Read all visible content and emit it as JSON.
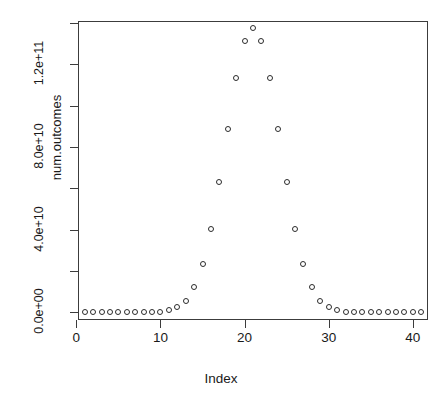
{
  "chart_data": {
    "type": "scatter",
    "title": "",
    "xlabel": "Index",
    "ylabel": "num.outcomes",
    "xlim": [
      0.2,
      41.8
    ],
    "ylim": [
      -3800000000,
      141000000000
    ],
    "grid": false,
    "legend": null,
    "point_symbol": "open-circle",
    "point_color": "#2b2b2b",
    "x": [
      1,
      2,
      3,
      4,
      5,
      6,
      7,
      8,
      9,
      10,
      11,
      12,
      13,
      14,
      15,
      16,
      17,
      18,
      19,
      20,
      21,
      22,
      23,
      24,
      25,
      26,
      27,
      28,
      29,
      30,
      31,
      32,
      33,
      34,
      35,
      36,
      37,
      38,
      39,
      40,
      41
    ],
    "y": [
      1,
      40,
      780,
      9880,
      91390,
      658008,
      3838380,
      18643560,
      76904685,
      273438880,
      847660528,
      2311801440,
      5586853480,
      12033222880,
      23206929840,
      40225345056,
      62852101650,
      88732378800,
      113380261800,
      131282408400,
      137846528820,
      131282408400,
      113380261800,
      88732378800,
      62852101650,
      40225345056,
      23206929840,
      12033222880,
      5586853480,
      2311801440,
      847660528,
      273438880,
      76904685,
      18643560,
      3838380,
      658008,
      91390,
      9880,
      780,
      40,
      1
    ],
    "x_ticks": [
      0,
      10,
      20,
      30,
      40
    ],
    "x_tick_labels": [
      "0",
      "10",
      "20",
      "30",
      "40"
    ],
    "y_ticks": [
      0,
      20000000000,
      40000000000,
      60000000000,
      80000000000,
      100000000000,
      120000000000,
      140000000000
    ],
    "y_major_ticks": [
      0,
      40000000000,
      80000000000,
      120000000000
    ],
    "y_major_tick_labels": [
      "0.0e+00",
      "4.0e+10",
      "8.0e+10",
      "1.2e+11"
    ]
  },
  "axes": {
    "x_title": "Index",
    "y_title": "num.outcomes"
  }
}
